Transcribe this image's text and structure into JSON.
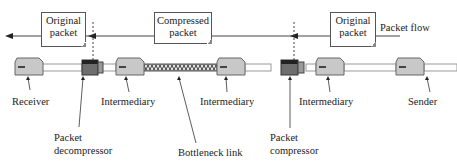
{
  "flow": {
    "label": "Packet flow",
    "direction": "right-to-left"
  },
  "packets": [
    {
      "id": "original-left",
      "line1": "Original",
      "line2": "packet"
    },
    {
      "id": "compressed",
      "line1": "Compressed",
      "line2": "packet"
    },
    {
      "id": "original-right",
      "line1": "Original",
      "line2": "packet"
    }
  ],
  "nodes": {
    "receiver": "Receiver",
    "intermediary_1": "Intermediary",
    "intermediary_2": "Intermediary",
    "intermediary_3": "Intermediary",
    "sender": "Sender",
    "decompressor_line1": "Packet",
    "decompressor_line2": "decompressor",
    "compressor_line1": "Packet",
    "compressor_line2": "compressor",
    "bottleneck": "Bottleneck link"
  },
  "colors": {
    "device_fill": "#c8c8c8",
    "compressor_fill": "#6e6e6e",
    "link": "#888888",
    "bottleneck_link": "#555555"
  }
}
